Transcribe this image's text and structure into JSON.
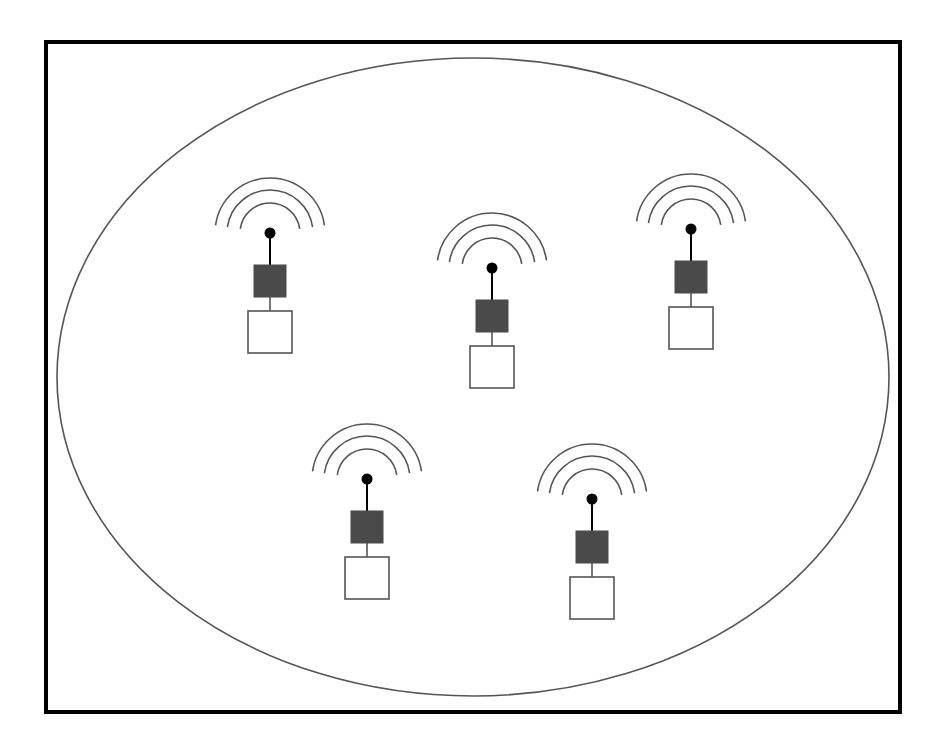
{
  "figure": {
    "type": "network-topology-diagram",
    "canvas": {
      "width": 943,
      "height": 747,
      "background": "#ffffff"
    }
  },
  "colors": {
    "stroke_dark": "#000000",
    "stroke_thin": "#333333",
    "ellipse_stroke": "#555555",
    "arc_stroke": "#555555",
    "module_fill": "#4a4a4a",
    "base_fill": "#ffffff",
    "base_stroke": "#555555",
    "background": "#ffffff"
  },
  "outer_boundary": {
    "shape": "rectangle",
    "x": 46,
    "y": 42,
    "width": 854,
    "height": 670,
    "stroke_width": 4,
    "fill": "none"
  },
  "coverage_area": {
    "shape": "ellipse",
    "cx": 473,
    "cy": 377,
    "rx": 416,
    "ry": 319,
    "stroke_width": 1.6,
    "fill": "none"
  },
  "node_style": {
    "dot_radius": 5.5,
    "arc_radii": [
      30,
      43,
      55
    ],
    "arc_stroke_width": 1.6,
    "arc_start_angle_deg": 188,
    "arc_end_angle_deg": 352,
    "mast_length": 32,
    "module": {
      "width": 32,
      "height": 32,
      "offset_y": 32
    },
    "link_length": 14,
    "base": {
      "width": 44,
      "height": 42,
      "offset_y": 78
    },
    "stem_stroke_width": 2
  },
  "nodes": [
    {
      "id": "node-1",
      "label": "Wireless node 1",
      "x": 270,
      "y": 233
    },
    {
      "id": "node-2",
      "label": "Wireless node 2",
      "x": 492,
      "y": 268
    },
    {
      "id": "node-3",
      "label": "Wireless node 3",
      "x": 691,
      "y": 229
    },
    {
      "id": "node-4",
      "label": "Wireless node 4",
      "x": 367,
      "y": 479
    },
    {
      "id": "node-5",
      "label": "Wireless node 5",
      "x": 592,
      "y": 499
    }
  ],
  "chart_data": {
    "type": "scatter",
    "xlabel": "",
    "ylabel": "",
    "xlim": [
      46,
      900
    ],
    "ylim": [
      42,
      712
    ],
    "grid": false,
    "legend": "none",
    "categories": [
      "node-1",
      "node-2",
      "node-3",
      "node-4",
      "node-5"
    ],
    "x": [
      270,
      492,
      691,
      367,
      592
    ],
    "y": [
      233,
      268,
      229,
      479,
      499
    ],
    "annotations": [
      "outer rectangular boundary",
      "inner elliptical coverage region",
      "5 wireless transmitter nodes with 3 radiating arcs each"
    ]
  }
}
